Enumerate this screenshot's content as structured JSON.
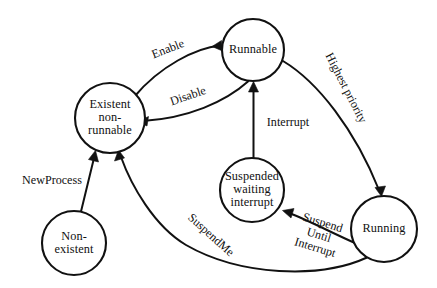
{
  "diagram": {
    "type": "state-diagram",
    "canvas": {
      "width": 437,
      "height": 288
    },
    "stroke_color": "#111111",
    "background_color": "#ffffff",
    "states": [
      {
        "id": "existent-non-runnable",
        "label": "Existent\nnon-\nrunnable",
        "cx": 110,
        "cy": 118,
        "r": 35
      },
      {
        "id": "runnable",
        "label": "Runnable",
        "cx": 253,
        "cy": 50,
        "r": 31
      },
      {
        "id": "suspended-waiting-interrupt",
        "label": "Suspended\nwaiting\ninterrupt",
        "cx": 252,
        "cy": 190,
        "r": 32
      },
      {
        "id": "running",
        "label": "Running",
        "cx": 384,
        "cy": 229,
        "r": 33
      },
      {
        "id": "non-existent",
        "label": "Non-\nexistent",
        "cx": 74,
        "cy": 243,
        "r": 32
      }
    ],
    "transitions": [
      {
        "id": "enable",
        "label": "Enable",
        "from": "existent-non-runnable",
        "to": "runnable",
        "label_x": 168,
        "label_y": 49,
        "label_rotation": -21
      },
      {
        "id": "disable",
        "label": "Disable",
        "from": "runnable",
        "to": "existent-non-runnable",
        "label_x": 188,
        "label_y": 96,
        "label_rotation": -19
      },
      {
        "id": "highest-priority",
        "label": "Highest priority",
        "from": "runnable",
        "to": "running",
        "label_x": 346,
        "label_y": 88,
        "label_rotation": 63
      },
      {
        "id": "interrupt",
        "label": "Interrupt",
        "from": "suspended-waiting-interrupt",
        "to": "runnable",
        "label_x": 288,
        "label_y": 122,
        "label_rotation": 0
      },
      {
        "id": "new-process",
        "label": "NewProcess",
        "from": "non-existent",
        "to": "existent-non-runnable",
        "label_x": 52,
        "label_y": 180,
        "label_rotation": 0
      },
      {
        "id": "suspend-me",
        "label": "SuspendMe",
        "from": "running",
        "to": "existent-non-runnable",
        "label_x": 211,
        "label_y": 235,
        "label_rotation": 42
      },
      {
        "id": "suspend-until-interrupt",
        "label": "Suspend\nUntil\nInterrupt",
        "from": "running",
        "to": "suspended-waiting-interrupt",
        "label_x": 319,
        "label_y": 235,
        "label_rotation": 17
      }
    ]
  }
}
